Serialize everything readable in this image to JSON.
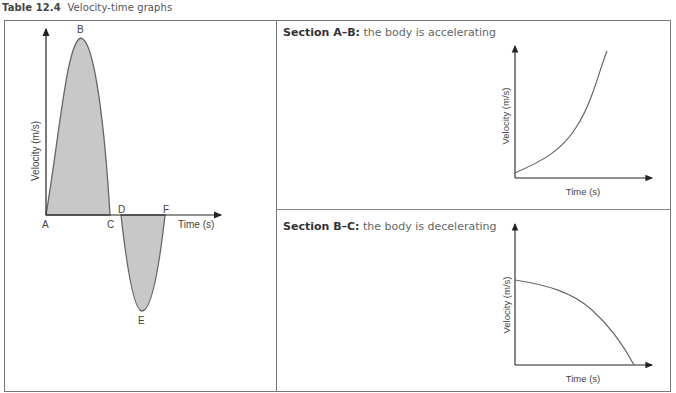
{
  "caption": {
    "label": "Table 12.4",
    "title": "Velocity-time graphs"
  },
  "main_graph": {
    "y_axis_label": "Velocity (m/s)",
    "x_axis_label": "Time (s)",
    "points": {
      "A": "A",
      "B": "B",
      "C": "C",
      "D": "D",
      "E": "E",
      "F": "F"
    }
  },
  "sections": [
    {
      "heading": "Section A–B:",
      "description": " the body is accelerating",
      "graph": {
        "y_axis_label": "Velocity (m/s)",
        "x_axis_label": "Time (s)",
        "curve": "increasing-concave-up"
      }
    },
    {
      "heading": "Section B–C:",
      "description": " the body is decelerating",
      "graph": {
        "y_axis_label": "Velocity (m/s)",
        "x_axis_label": "Time (s)",
        "curve": "decreasing-concave-down"
      }
    }
  ],
  "colors": {
    "fill": "#c8c8c8",
    "curve": "#666666",
    "axis": "#222222",
    "border": "#777777"
  }
}
